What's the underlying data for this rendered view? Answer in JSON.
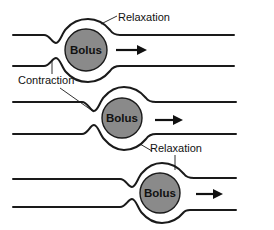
{
  "diagram": {
    "stages": [
      {
        "id": 1,
        "bolus_label": "Bolus",
        "arrow": "right-arrow"
      },
      {
        "id": 2,
        "bolus_label": "Bolus",
        "arrow": "right-arrow"
      },
      {
        "id": 3,
        "bolus_label": "Bolus",
        "arrow": "right-arrow"
      }
    ],
    "labels": {
      "relaxation_top": "Relaxation",
      "contraction": "Contraction",
      "relaxation_bottom": "Relaxation"
    },
    "colors": {
      "bolus_fill": "#8a8a8a",
      "line": "#1a1a1a",
      "background": "#ffffff"
    }
  }
}
